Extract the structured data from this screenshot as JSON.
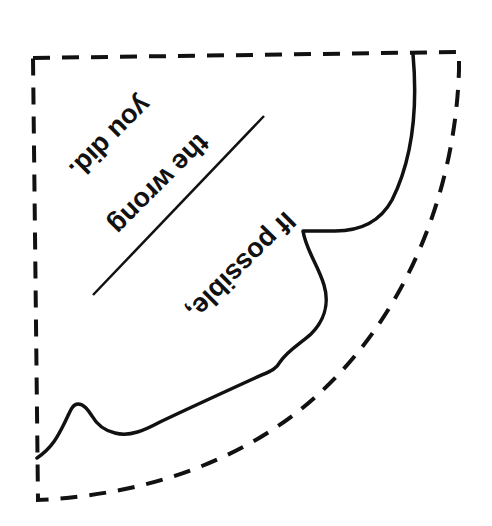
{
  "template": {
    "type": "cut-out quarter-circle pattern",
    "colors": {
      "background": "#ffffff",
      "ink": "#111111"
    },
    "text_lines": [
      {
        "id": "line1",
        "text": "If possible,",
        "rotation_deg": 135
      },
      {
        "id": "line2",
        "text": "the wrong",
        "rotation_deg": 135
      },
      {
        "id": "line3",
        "text": "you did.",
        "rotation_deg": 135
      }
    ],
    "cut_line_style": "dashed",
    "fold_line_style": "solid"
  }
}
